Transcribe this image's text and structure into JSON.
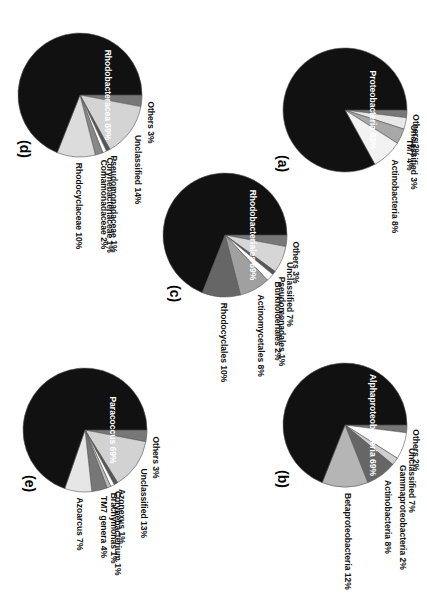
{
  "chart_data": [
    {
      "type": "pie",
      "panel": "(a)",
      "labels": [
        "Proteobacteria",
        "Actinobacteria",
        "TM7",
        "Unclassified",
        "Others"
      ],
      "values": [
        83,
        8,
        4,
        3,
        2
      ],
      "label_text": [
        "Proteobacteria 83%",
        "Actinobacteria 8%",
        "TM7 4%",
        "Unclassified 3%",
        "Others 2%"
      ],
      "colors": [
        "#111111",
        "#f2f2f2",
        "#a8a8a8",
        "#e8e8e8",
        "#777777"
      ]
    },
    {
      "type": "pie",
      "panel": "(b)",
      "labels": [
        "Alphaproteobacteria",
        "Betaproteobacteria",
        "Actinobacteria",
        "Gammaproteobacteria",
        "Unclassified",
        "Others"
      ],
      "values": [
        69,
        12,
        8,
        2,
        7,
        2
      ],
      "label_text": [
        "Alphaproteobacteria 69%",
        "Betaproteobacteria 12%",
        "Actinobacteria 8%",
        "Gammaproteobacteria 2%",
        "Unclassified 7%",
        "Others 2%"
      ],
      "colors": [
        "#111111",
        "#b5b5b5",
        "#666666",
        "#cfcfcf",
        "#ffffff",
        "#777777"
      ]
    },
    {
      "type": "pie",
      "panel": "(c)",
      "labels": [
        "Rhodobacteriales",
        "Rhodocyclales",
        "Actinomycetales",
        "Burkholderiales",
        "Pseudomonadales",
        "Unclassified",
        "Others"
      ],
      "values": [
        69,
        10,
        8,
        2,
        1,
        7,
        3
      ],
      "label_text": [
        "Rhodobacteriales 69%",
        "Rhodocyclales 10%",
        "Actinomycetales 8%",
        "Burkholderiales 2%",
        "Pseudomonadales 1%",
        "Unclassified 7%",
        "Others 3%"
      ],
      "colors": [
        "#111111",
        "#666666",
        "#a0a0a0",
        "#ffffff",
        "#555555",
        "#d6d6d6",
        "#777777"
      ]
    },
    {
      "type": "pie",
      "panel": "(d)",
      "labels": [
        "Rhodobacteracea",
        "Rhodocyclaceae",
        "Comamonadaceae",
        "Corynebacteriaceae",
        "Pseudomonadaceae",
        "Unclassified",
        "Others"
      ],
      "values": [
        69,
        10,
        2,
        1,
        1,
        14,
        3
      ],
      "label_text": [
        "Rhodobacteracea 69%",
        "Rhodocyclaceae 10%",
        "Comamonadaceae 2%",
        "Corynebacteriaceae 1%",
        "Pseudomonadaceae 1%",
        "Unclassified 14%",
        "Others 3%"
      ],
      "colors": [
        "#111111",
        "#dcdcdc",
        "#888888",
        "#ffffff",
        "#555555",
        "#d4d4d4",
        "#777777"
      ]
    },
    {
      "type": "pie",
      "panel": "(e)",
      "labels": [
        "Paracoccus",
        "Azoarcus",
        "TM7 genera",
        "Brachymonas",
        "Corynebacterium",
        "Azonexus",
        "Unclassified",
        "Others"
      ],
      "values": [
        69,
        7,
        4,
        1,
        1,
        1,
        13,
        3
      ],
      "label_text": [
        "Paracoccus 69%",
        "Azoarcus 7%",
        "TM7 genera 4%",
        "Brachymonas 1%",
        "Corynebacterium 1%",
        "Azonexus 1%",
        "Unclassified 13%",
        "Others 3%"
      ],
      "colors": [
        "#111111",
        "#e6e6e6",
        "#777777",
        "#bbbbbb",
        "#ffffff",
        "#555555",
        "#d2d2d2",
        "#777777"
      ]
    }
  ],
  "panels": {
    "a": {
      "tag": "(a)"
    },
    "b": {
      "tag": "(b)"
    },
    "c": {
      "tag": "(c)"
    },
    "d": {
      "tag": "(d)"
    },
    "e": {
      "tag": "(e)"
    }
  }
}
